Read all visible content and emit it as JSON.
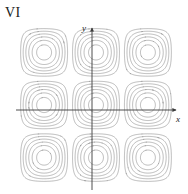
{
  "figure": {
    "panel_label": "VI",
    "axis_x_label": "x",
    "axis_y_label": "y"
  },
  "chart_data": {
    "type": "line",
    "title": "VI",
    "subtitle": "",
    "xlabel": "x",
    "ylabel": "y",
    "grid": false,
    "legend": null,
    "function": "z = cos(x)*cos(y)",
    "xlim": [
      -4.6,
      4.6
    ],
    "ylim": [
      -4.6,
      4.6
    ],
    "origin_pixel": [
      92,
      110
    ],
    "plot_box_pixel": {
      "left": 20,
      "top": 28,
      "right": 172,
      "bottom": 182
    },
    "contour_levels": [
      -0.9,
      -0.75,
      -0.6,
      -0.45,
      -0.3,
      -0.15,
      0.15,
      0.3,
      0.45,
      0.6,
      0.75,
      0.9
    ],
    "extrema": [
      {
        "type": "maximum",
        "x": 0,
        "y": 0,
        "z": 1
      },
      {
        "type": "maximum",
        "x": -3.14159,
        "y": -3.14159,
        "z": 1
      },
      {
        "type": "maximum",
        "x": 3.14159,
        "y": -3.14159,
        "z": 1
      },
      {
        "type": "maximum",
        "x": -3.14159,
        "y": 3.14159,
        "z": 1
      },
      {
        "type": "maximum",
        "x": 3.14159,
        "y": 3.14159,
        "z": 1
      },
      {
        "type": "minimum",
        "x": 0,
        "y": 3.14159,
        "z": -1
      },
      {
        "type": "minimum",
        "x": 0,
        "y": -3.14159,
        "z": -1
      },
      {
        "type": "minimum",
        "x": 3.14159,
        "y": 0,
        "z": -1
      },
      {
        "type": "minimum",
        "x": -3.14159,
        "y": 0,
        "z": -1
      }
    ],
    "colors": {
      "contour": "#808080",
      "axis": "#3a3a3a",
      "background": "#ffffff",
      "text": "#1a1a1a"
    }
  }
}
